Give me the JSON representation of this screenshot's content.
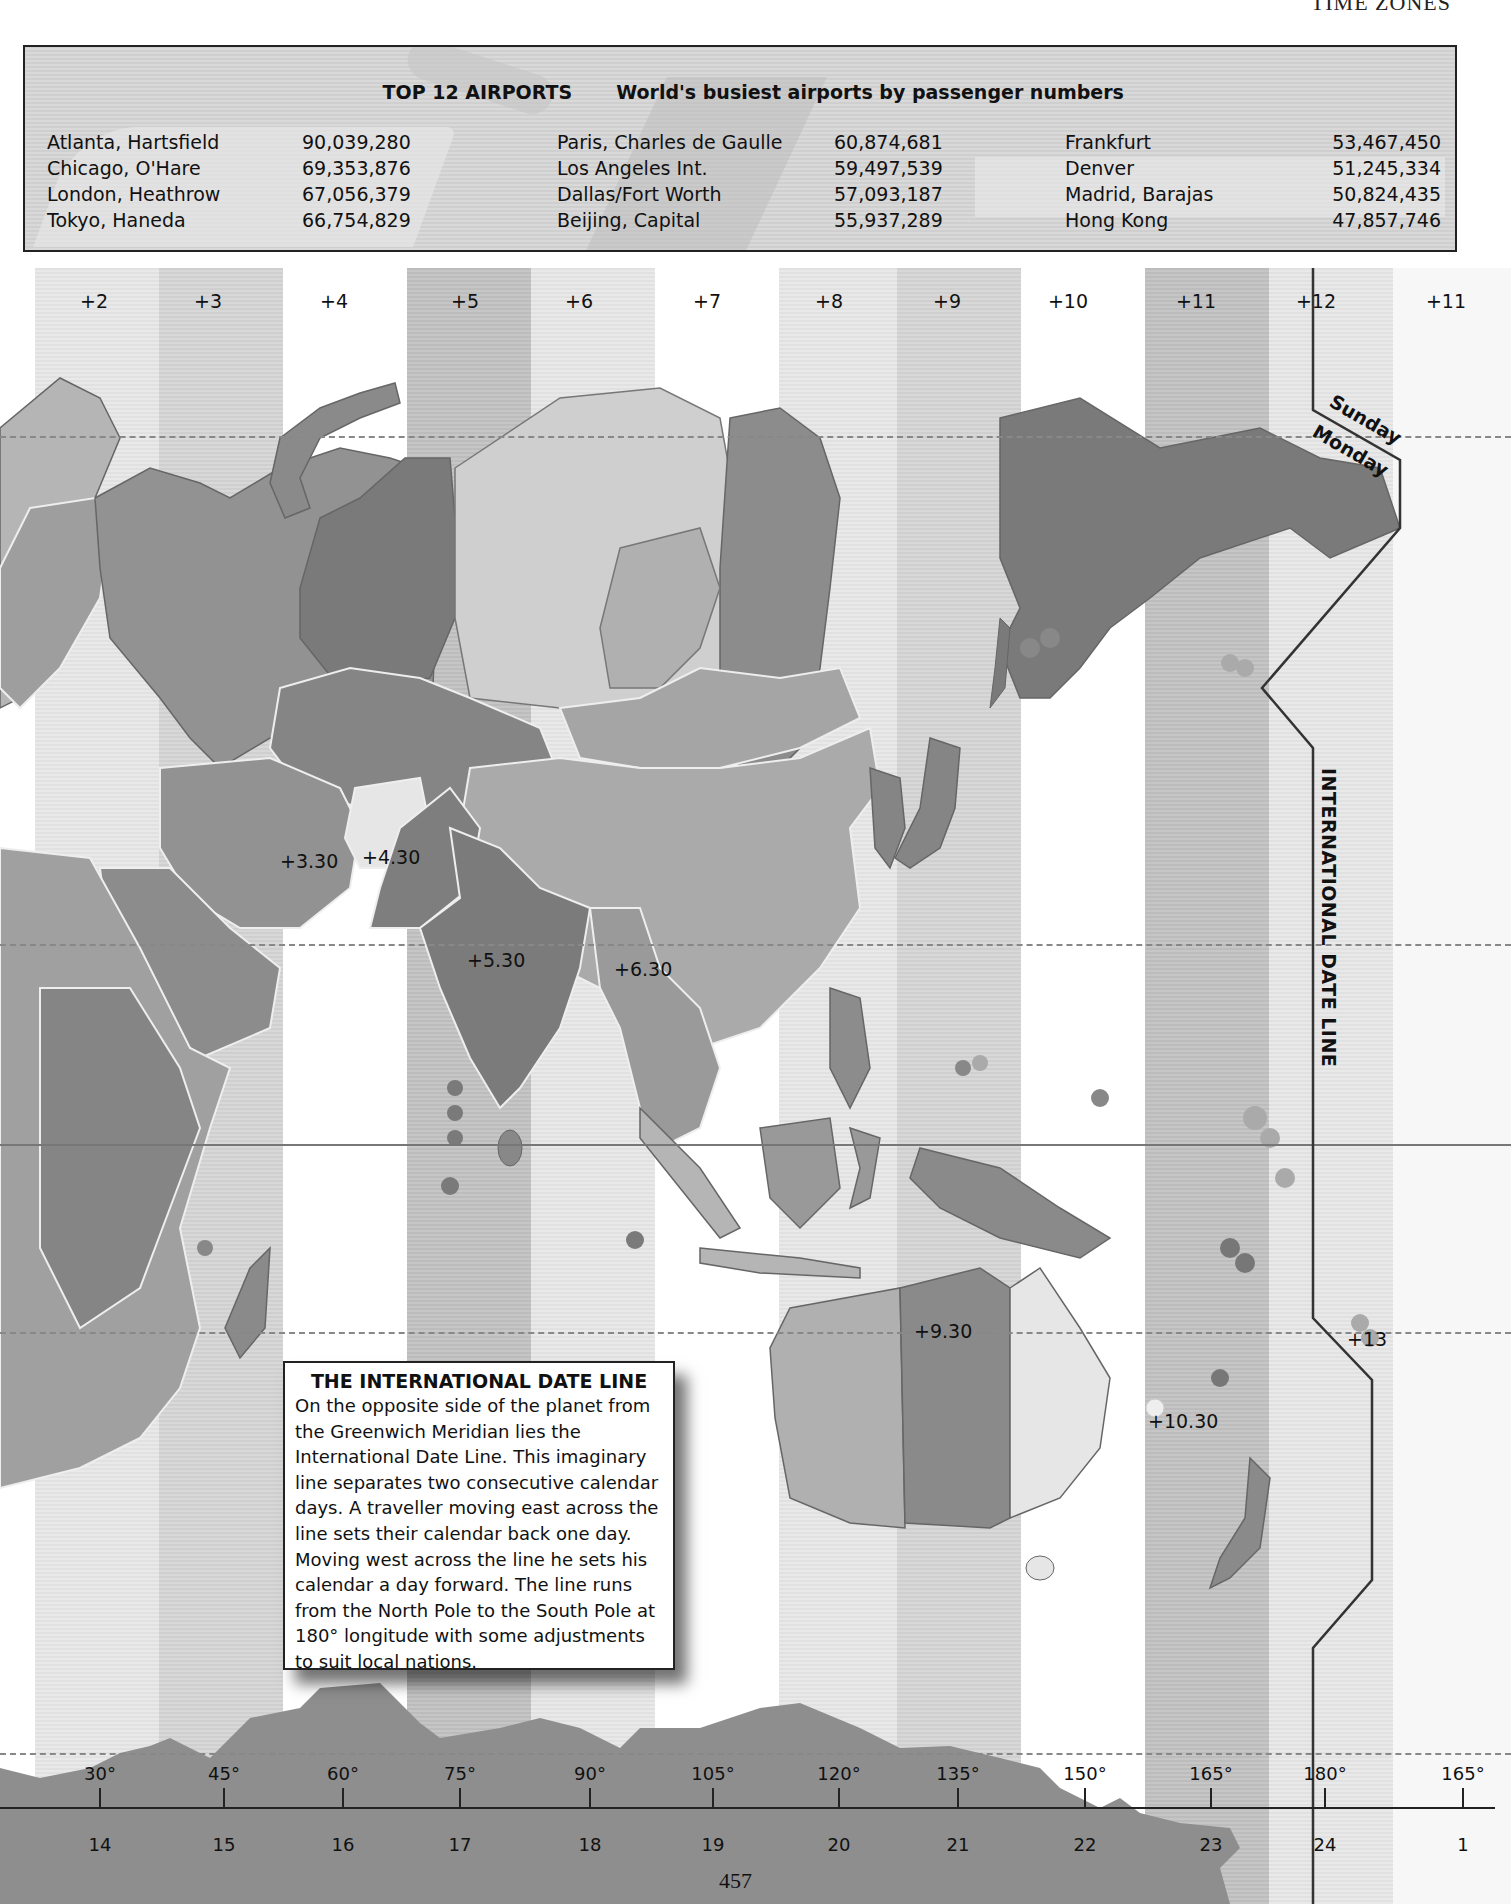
{
  "running_head": "TIME ZONES",
  "airports_panel": {
    "title": "TOP 12 AIRPORTS",
    "subtitle": "World's busiest airports by passenger numbers",
    "columns": [
      [
        {
          "name": "Atlanta, Hartsfield",
          "passengers": "90,039,280"
        },
        {
          "name": "Chicago, O'Hare",
          "passengers": "69,353,876"
        },
        {
          "name": "London, Heathrow",
          "passengers": "67,056,379"
        },
        {
          "name": "Tokyo, Haneda",
          "passengers": "66,754,829"
        }
      ],
      [
        {
          "name": "Paris, Charles de Gaulle",
          "passengers": "60,874,681"
        },
        {
          "name": "Los Angeles Int.",
          "passengers": "59,497,539"
        },
        {
          "name": "Dallas/Fort Worth",
          "passengers": "57,093,187"
        },
        {
          "name": "Beijing, Capital",
          "passengers": "55,937,289"
        }
      ],
      [
        {
          "name": "Frankfurt",
          "passengers": "53,467,450"
        },
        {
          "name": "Denver",
          "passengers": "51,245,334"
        },
        {
          "name": "Madrid, Barajas",
          "passengers": "50,824,435"
        },
        {
          "name": "Hong Kong",
          "passengers": "47,857,746"
        }
      ]
    ]
  },
  "map": {
    "zone_labels": [
      "+2",
      "+3",
      "+4",
      "+5",
      "+6",
      "+7",
      "+8",
      "+9",
      "+10",
      "+11",
      "+12",
      "+11"
    ],
    "offset_labels": {
      "iran": "+3.30",
      "afghanistan": "+4.30",
      "india": "+5.30",
      "myanmar": "+6.30",
      "central_australia": "+9.30",
      "lord_howe": "+10.30",
      "tonga": "+13"
    },
    "date_line_label": "INTERNATIONAL DATE LINE",
    "day_west": "Sunday",
    "day_east": "Monday"
  },
  "infobox": {
    "title": "THE INTERNATIONAL DATE LINE",
    "body": "On the opposite side of the planet from the Greenwich Meridian lies the International Date Line. This imaginary line separates two consecutive calendar days. A traveller moving east across the line sets their calendar back one day. Moving west across the line he sets his calendar a day forward. The line runs from the North Pole to the South Pole at 180° longitude with some adjustments to suit local nations."
  },
  "scale": {
    "degrees": [
      "30°",
      "45°",
      "60°",
      "75°",
      "90°",
      "105°",
      "120°",
      "135°",
      "150°",
      "165°",
      "180°",
      "165°"
    ],
    "hours": [
      "14",
      "15",
      "16",
      "17",
      "18",
      "19",
      "20",
      "21",
      "22",
      "23",
      "24",
      "1"
    ]
  },
  "page_number": "457"
}
